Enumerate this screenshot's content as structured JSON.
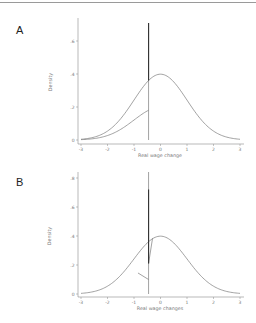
{
  "chart_data": [
    {
      "panel": "A",
      "type": "line",
      "xlabel": "Real wage change",
      "ylabel": "Density",
      "xlim": [
        -3,
        3
      ],
      "ylim": [
        0,
        0.7
      ],
      "x_ticks": [
        "-3",
        "-2",
        "-1",
        "0",
        "1",
        "2",
        "3"
      ],
      "y_ticks": [
        "0",
        ".2",
        ".4",
        ".6"
      ],
      "grid": false,
      "legend": null,
      "series": [
        {
          "name": "notional (normal density)",
          "x": [
            -3,
            -2,
            -1,
            -0.45,
            0,
            1,
            2,
            3
          ],
          "y": [
            0.004,
            0.054,
            0.242,
            0.36,
            0.399,
            0.242,
            0.054,
            0.004
          ]
        },
        {
          "name": "observed (left tail scaled)",
          "x": [
            -3,
            -2,
            -1,
            -0.45
          ],
          "y": [
            0.002,
            0.027,
            0.121,
            0.18
          ]
        },
        {
          "name": "spike at rigidity point",
          "x": [
            -0.45,
            -0.45
          ],
          "y": [
            0,
            0.72
          ]
        }
      ]
    },
    {
      "panel": "B",
      "type": "line",
      "xlabel": "Real wage changes",
      "ylabel": "Density",
      "xlim": [
        -3,
        3
      ],
      "ylim": [
        0,
        0.85
      ],
      "x_ticks": [
        "-3",
        "-2",
        "-1",
        "0",
        "1",
        "2",
        "3"
      ],
      "y_ticks": [
        "0",
        ".2",
        ".4",
        ".6",
        ".8"
      ],
      "grid": false,
      "legend": null,
      "series": [
        {
          "name": "notional (normal density)",
          "x": [
            -3,
            -2,
            -1,
            -0.45,
            0,
            1,
            2,
            3
          ],
          "y": [
            0.004,
            0.054,
            0.242,
            0.36,
            0.399,
            0.242,
            0.054,
            0.004
          ]
        },
        {
          "name": "observed with spike",
          "x": [
            -0.8,
            -0.6,
            -0.45,
            -0.45,
            -0.45,
            -0.3
          ],
          "y": [
            0.15,
            0.1,
            0.2,
            0.8,
            0.2,
            0.38
          ]
        },
        {
          "name": "spike at rigidity point",
          "x": [
            -0.45,
            -0.45
          ],
          "y": [
            0,
            0.8
          ]
        }
      ]
    }
  ],
  "panels": {
    "a": {
      "label": "A"
    },
    "b": {
      "label": "B"
    }
  }
}
